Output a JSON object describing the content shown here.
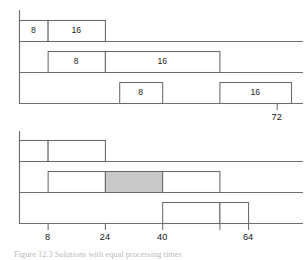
{
  "figure": {
    "caption": "Figure 12.3  Solutions with equal processing times",
    "charts": [
      {
        "id": "top-chart",
        "axis": {
          "x_min": 0,
          "x_max": 76,
          "labeled_ticks": [
            {
              "value": 72,
              "label": "72"
            }
          ],
          "tick_labels_below": true
        },
        "tracks": [
          {
            "id": "top-track-1",
            "boxes": [
              {
                "start": 0,
                "end": 8,
                "label": "8",
                "shaded": false
              },
              {
                "start": 8,
                "end": 24,
                "label": "16",
                "shaded": false
              }
            ]
          },
          {
            "id": "top-track-2",
            "boxes": [
              {
                "start": 8,
                "end": 24,
                "label": "8",
                "shaded": false
              },
              {
                "start": 24,
                "end": 56,
                "label": "16",
                "shaded": false
              }
            ]
          },
          {
            "id": "top-track-3",
            "boxes": [
              {
                "start": 28,
                "end": 40,
                "label": "8",
                "shaded": false
              },
              {
                "start": 56,
                "end": 76,
                "label": "16",
                "shaded": false
              }
            ]
          }
        ]
      },
      {
        "id": "bottom-chart",
        "axis": {
          "x_min": 0,
          "x_max": 76,
          "labeled_ticks": [
            {
              "value": 8,
              "label": "8"
            },
            {
              "value": 24,
              "label": "24"
            },
            {
              "value": 40,
              "label": "40"
            },
            {
              "value": 64,
              "label": "64"
            }
          ],
          "unlabeled_ticks": [
            56
          ],
          "tick_labels_below": true
        },
        "tracks": [
          {
            "id": "bottom-track-1",
            "boxes": [
              {
                "start": 0,
                "end": 8,
                "label": "",
                "shaded": false
              },
              {
                "start": 8,
                "end": 24,
                "label": "",
                "shaded": false
              }
            ]
          },
          {
            "id": "bottom-track-2",
            "boxes": [
              {
                "start": 8,
                "end": 24,
                "label": "",
                "shaded": false
              },
              {
                "start": 24,
                "end": 40,
                "label": "",
                "shaded": true
              },
              {
                "start": 40,
                "end": 56,
                "label": "",
                "shaded": false
              }
            ]
          },
          {
            "id": "bottom-track-3",
            "boxes": [
              {
                "start": 40,
                "end": 56,
                "label": "",
                "shaded": false
              },
              {
                "start": 56,
                "end": 64,
                "label": "",
                "shaded": false
              }
            ]
          }
        ]
      }
    ],
    "colors": {
      "line": "#6f6f6f",
      "box_stroke": "#6a6a6a",
      "box_fill": "#ffffff",
      "box_fill_shaded": "#c9c9c9",
      "text": "#1b1b1b",
      "caption": "#b9bcc2",
      "background": "#ffffff"
    }
  },
  "chart_data": {
    "type": "bar",
    "title": "",
    "xlabel": "",
    "ylabel": "",
    "xlim": [
      0,
      76
    ],
    "grid": false,
    "legend": null,
    "subcharts": [
      {
        "name": "top-chart",
        "description": "Three-machine Gantt schedule; each job shows a processing time of 8 then 16",
        "axis_ticks": [
          72
        ],
        "axis_tick_labels": [
          "72"
        ],
        "series": [
          {
            "name": "track-1",
            "segments": [
              {
                "start": 0,
                "end": 8,
                "duration": 8,
                "label": "8",
                "shaded": false
              },
              {
                "start": 8,
                "end": 24,
                "duration": 16,
                "label": "16",
                "shaded": false
              }
            ]
          },
          {
            "name": "track-2",
            "segments": [
              {
                "start": 8,
                "end": 24,
                "duration": 16,
                "label": "8",
                "shaded": false
              },
              {
                "start": 24,
                "end": 56,
                "duration": 32,
                "label": "16",
                "shaded": false
              }
            ]
          },
          {
            "name": "track-3",
            "segments": [
              {
                "start": 28,
                "end": 40,
                "duration": 12,
                "label": "8",
                "shaded": false
              },
              {
                "start": 56,
                "end": 76,
                "duration": 20,
                "label": "16",
                "shaded": false
              }
            ]
          }
        ]
      },
      {
        "name": "bottom-chart",
        "description": "Three-machine Gantt schedule with one shaded (idle/critical) block",
        "axis_ticks": [
          8,
          24,
          40,
          56,
          64
        ],
        "axis_tick_labels": [
          "8",
          "24",
          "40",
          "",
          "64"
        ],
        "series": [
          {
            "name": "track-1",
            "segments": [
              {
                "start": 0,
                "end": 8,
                "duration": 8,
                "label": "",
                "shaded": false
              },
              {
                "start": 8,
                "end": 24,
                "duration": 16,
                "label": "",
                "shaded": false
              }
            ]
          },
          {
            "name": "track-2",
            "segments": [
              {
                "start": 8,
                "end": 24,
                "duration": 16,
                "label": "",
                "shaded": false
              },
              {
                "start": 24,
                "end": 40,
                "duration": 16,
                "label": "",
                "shaded": true
              },
              {
                "start": 40,
                "end": 56,
                "duration": 16,
                "label": "",
                "shaded": false
              }
            ]
          },
          {
            "name": "track-3",
            "segments": [
              {
                "start": 40,
                "end": 56,
                "duration": 16,
                "label": "",
                "shaded": false
              },
              {
                "start": 56,
                "end": 64,
                "duration": 8,
                "label": "",
                "shaded": false
              }
            ]
          }
        ]
      }
    ]
  }
}
